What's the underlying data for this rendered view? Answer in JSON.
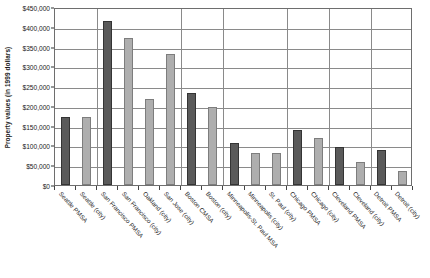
{
  "chart_data": {
    "type": "bar",
    "title": "",
    "xlabel": "",
    "ylabel": "Property values (in 1999 dollars)",
    "ylim": [
      0,
      450000
    ],
    "ytick_step": 50000,
    "ytick_labels": [
      "$450,000",
      "$400,000",
      "$350,000",
      "$300,000",
      "$250,000",
      "$200,000",
      "$150,000",
      "$100,000",
      "$50,000",
      "$0"
    ],
    "ytick_values": [
      450000,
      400000,
      350000,
      300000,
      250000,
      200000,
      150000,
      100000,
      50000,
      0
    ],
    "grid": true,
    "legend_position": "none",
    "colors": {
      "metro": "#5a5a5a",
      "city": "#aeaeae",
      "gridline": "#8a8a8a",
      "axis": "#6e6e6e",
      "background": "#ffffff"
    },
    "categories": [
      "Seattle PMSA",
      "Seattle (city)",
      "San Francisco PMSA",
      "San Francisco (city)",
      "Oakland (city)",
      "San Jose (city)",
      "Boston CMSA",
      "Boston (city)",
      "Minneapolis-St. Paul MSA",
      "Minneapolis (city)",
      "St. Paul (city)",
      "Chicago PMSA",
      "Chicago (city)",
      "Cleveland PMSA",
      "Cleveland (city)",
      "Detroit PMSA",
      "Detroit (city)"
    ],
    "values": [
      172000,
      171000,
      415000,
      372000,
      218000,
      330000,
      232000,
      198000,
      105000,
      82000,
      80000,
      138000,
      120000,
      95000,
      58000,
      88000,
      35000
    ],
    "bar_kinds": [
      "metro",
      "city",
      "metro",
      "city",
      "city",
      "city",
      "metro",
      "city",
      "metro",
      "city",
      "city",
      "metro",
      "city",
      "metro",
      "city",
      "metro",
      "city"
    ],
    "groups": [
      {
        "name": "Seattle",
        "count": 2
      },
      {
        "name": "San Francisco Bay Area",
        "count": 4
      },
      {
        "name": "Boston",
        "count": 2
      },
      {
        "name": "Minneapolis-St. Paul",
        "count": 3
      },
      {
        "name": "Chicago",
        "count": 2
      },
      {
        "name": "Cleveland",
        "count": 2
      },
      {
        "name": "Detroit",
        "count": 2
      }
    ]
  }
}
